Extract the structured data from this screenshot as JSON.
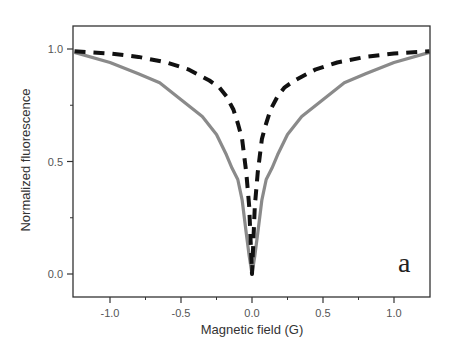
{
  "chart_data": {
    "type": "line",
    "title": "",
    "xlabel": "Magnetic field (G)",
    "ylabel": "Normalized fluorescence",
    "xlim": [
      -1.26,
      1.25
    ],
    "ylim": [
      -0.1,
      1.1
    ],
    "xticks": [
      -1.0,
      -0.5,
      0.0,
      0.5,
      1.0
    ],
    "xtick_labels": [
      "-1.0",
      "-0.5",
      "0.0",
      "0.5",
      "1.0"
    ],
    "yticks": [
      0.0,
      0.5,
      1.0
    ],
    "ytick_labels": [
      "0.0",
      "0.5",
      "1.0"
    ],
    "grid": false,
    "legend": null,
    "annotation": "a",
    "series": [
      {
        "name": "solid gray (measured)",
        "style": "solid",
        "color": "#8a8a8a",
        "symmetric_about_zero": true,
        "x": [
          0,
          0.02,
          0.04,
          0.07,
          0.1,
          0.14,
          0.18,
          0.25,
          0.35,
          0.49,
          0.65,
          0.8,
          1.0,
          1.25
        ],
        "y": [
          0.0,
          0.08,
          0.18,
          0.33,
          0.42,
          0.47,
          0.53,
          0.62,
          0.7,
          0.77,
          0.85,
          0.89,
          0.94,
          0.985
        ]
      },
      {
        "name": "dashed black (calculated)",
        "style": "dashed",
        "color": "#111111",
        "symmetric_about_zero": true,
        "x": [
          0,
          0.01,
          0.02,
          0.04,
          0.07,
          0.1,
          0.13,
          0.18,
          0.23,
          0.3,
          0.45,
          0.6,
          0.8,
          1.0,
          1.25
        ],
        "y": [
          0.0,
          0.15,
          0.3,
          0.45,
          0.6,
          0.67,
          0.73,
          0.79,
          0.83,
          0.86,
          0.91,
          0.94,
          0.965,
          0.98,
          0.99
        ]
      }
    ]
  }
}
